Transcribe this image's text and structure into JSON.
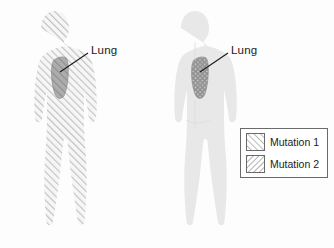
{
  "figure": {
    "type": "biology-diagram",
    "panels": [
      {
        "id": "left",
        "body_fill": "mutation-1-hatch",
        "organ": {
          "name": "Lung",
          "fill": "mutation-1-hatch-dark"
        },
        "label": "Lung"
      },
      {
        "id": "right",
        "body_fill": "plain-gray",
        "organ": {
          "name": "Lung",
          "fill": "mutation-1-and-2-crosshatch"
        },
        "label": "Lung"
      }
    ]
  },
  "legend": {
    "items": [
      {
        "label": "Mutation 1",
        "pattern": "forward-slash-hatch",
        "swatch_name": "mutation-1-swatch"
      },
      {
        "label": "Mutation 2",
        "pattern": "back-slash-hatch",
        "swatch_name": "mutation-2-swatch"
      }
    ]
  },
  "colors": {
    "body_gray": "#d8d8d8",
    "body_gray_light": "#e4e4e4",
    "hatch_line": "#b5b5b5",
    "organ_gray": "#9a9a9a",
    "organ_outline": "#8a8a8a",
    "legend_border": "#6a6a6a",
    "text": "#1b1b1b",
    "leader_line": "#1b1b1b",
    "background": "#fdfdfd"
  }
}
